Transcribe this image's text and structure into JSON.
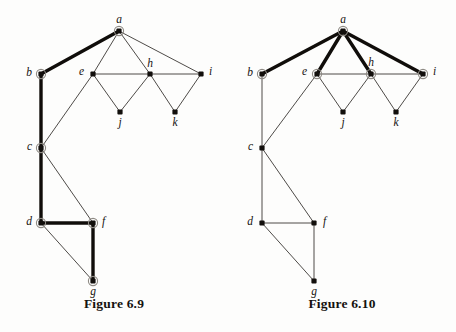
{
  "figures": [
    {
      "id": "figure-6-9",
      "caption": "Figure 6.9",
      "nodes": [
        {
          "id": "a",
          "label": "a",
          "x": 119,
          "y": 31,
          "marked": true,
          "label_dx": 0,
          "label_dy": -8,
          "label_anchor": "middle"
        },
        {
          "id": "b",
          "label": "b",
          "x": 41,
          "y": 74,
          "marked": true,
          "label_dx": -9,
          "label_dy": 2,
          "label_anchor": "end"
        },
        {
          "id": "c",
          "label": "c",
          "x": 41,
          "y": 148,
          "marked": true,
          "label_dx": -9,
          "label_dy": 2,
          "label_anchor": "end"
        },
        {
          "id": "d",
          "label": "d",
          "x": 41,
          "y": 223,
          "marked": true,
          "label_dx": -9,
          "label_dy": 2,
          "label_anchor": "end"
        },
        {
          "id": "e",
          "label": "e",
          "x": 93,
          "y": 74,
          "marked": false,
          "label_dx": -9,
          "label_dy": 1,
          "label_anchor": "end"
        },
        {
          "id": "f",
          "label": "f",
          "x": 93,
          "y": 223,
          "marked": true,
          "label_dx": 9,
          "label_dy": 2,
          "label_anchor": "start"
        },
        {
          "id": "g",
          "label": "g",
          "x": 93,
          "y": 281,
          "marked": true,
          "label_dx": 0,
          "label_dy": 14,
          "label_anchor": "middle"
        },
        {
          "id": "h",
          "label": "h",
          "x": 150,
          "y": 74,
          "marked": false,
          "label_dx": 0,
          "label_dy": -7,
          "label_anchor": "middle"
        },
        {
          "id": "i",
          "label": "i",
          "x": 201,
          "y": 74,
          "marked": false,
          "label_dx": 8,
          "label_dy": 1,
          "label_anchor": "start"
        },
        {
          "id": "j",
          "label": "j",
          "x": 120,
          "y": 112,
          "marked": false,
          "label_dx": 0,
          "label_dy": 14,
          "label_anchor": "middle"
        },
        {
          "id": "k",
          "label": "k",
          "x": 175,
          "y": 112,
          "marked": false,
          "label_dx": 0,
          "label_dy": 14,
          "label_anchor": "middle"
        }
      ],
      "edges": [
        {
          "from": "a",
          "to": "b",
          "bold": true
        },
        {
          "from": "a",
          "to": "e",
          "bold": false
        },
        {
          "from": "a",
          "to": "h",
          "bold": false
        },
        {
          "from": "a",
          "to": "i",
          "bold": false
        },
        {
          "from": "b",
          "to": "c",
          "bold": true
        },
        {
          "from": "c",
          "to": "d",
          "bold": true
        },
        {
          "from": "c",
          "to": "e",
          "bold": false
        },
        {
          "from": "c",
          "to": "f",
          "bold": false
        },
        {
          "from": "d",
          "to": "f",
          "bold": true
        },
        {
          "from": "d",
          "to": "g",
          "bold": false
        },
        {
          "from": "f",
          "to": "g",
          "bold": true
        },
        {
          "from": "e",
          "to": "h",
          "bold": false
        },
        {
          "from": "e",
          "to": "j",
          "bold": false
        },
        {
          "from": "h",
          "to": "j",
          "bold": false
        },
        {
          "from": "h",
          "to": "i",
          "bold": false
        },
        {
          "from": "h",
          "to": "k",
          "bold": false
        },
        {
          "from": "i",
          "to": "k",
          "bold": false
        }
      ]
    },
    {
      "id": "figure-6-10",
      "caption": "Figure 6.10",
      "nodes": [
        {
          "id": "a",
          "label": "a",
          "x": 115,
          "y": 31,
          "marked": true,
          "label_dx": 0,
          "label_dy": -8,
          "label_anchor": "middle"
        },
        {
          "id": "b",
          "label": "b",
          "x": 34,
          "y": 74,
          "marked": true,
          "label_dx": -9,
          "label_dy": 2,
          "label_anchor": "end"
        },
        {
          "id": "c",
          "label": "c",
          "x": 34,
          "y": 148,
          "marked": false,
          "label_dx": -9,
          "label_dy": 2,
          "label_anchor": "end"
        },
        {
          "id": "d",
          "label": "d",
          "x": 34,
          "y": 223,
          "marked": false,
          "label_dx": -9,
          "label_dy": 2,
          "label_anchor": "end"
        },
        {
          "id": "e",
          "label": "e",
          "x": 89,
          "y": 74,
          "marked": true,
          "label_dx": -10,
          "label_dy": 1,
          "label_anchor": "end"
        },
        {
          "id": "f",
          "label": "f",
          "x": 86,
          "y": 223,
          "marked": false,
          "label_dx": 9,
          "label_dy": 2,
          "label_anchor": "start"
        },
        {
          "id": "g",
          "label": "g",
          "x": 86,
          "y": 281,
          "marked": false,
          "label_dx": 0,
          "label_dy": 14,
          "label_anchor": "middle"
        },
        {
          "id": "h",
          "label": "h",
          "x": 143,
          "y": 74,
          "marked": true,
          "label_dx": 0,
          "label_dy": -8,
          "label_anchor": "middle"
        },
        {
          "id": "i",
          "label": "i",
          "x": 195,
          "y": 74,
          "marked": true,
          "label_dx": 10,
          "label_dy": 1,
          "label_anchor": "start"
        },
        {
          "id": "j",
          "label": "j",
          "x": 115,
          "y": 112,
          "marked": false,
          "label_dx": 0,
          "label_dy": 14,
          "label_anchor": "middle"
        },
        {
          "id": "k",
          "label": "k",
          "x": 168,
          "y": 112,
          "marked": false,
          "label_dx": 0,
          "label_dy": 14,
          "label_anchor": "middle"
        }
      ],
      "edges": [
        {
          "from": "a",
          "to": "b",
          "bold": true
        },
        {
          "from": "a",
          "to": "e",
          "bold": true
        },
        {
          "from": "a",
          "to": "h",
          "bold": true
        },
        {
          "from": "a",
          "to": "i",
          "bold": true
        },
        {
          "from": "b",
          "to": "c",
          "bold": false
        },
        {
          "from": "c",
          "to": "d",
          "bold": false
        },
        {
          "from": "c",
          "to": "e",
          "bold": false
        },
        {
          "from": "c",
          "to": "f",
          "bold": false
        },
        {
          "from": "d",
          "to": "f",
          "bold": false
        },
        {
          "from": "d",
          "to": "g",
          "bold": false
        },
        {
          "from": "f",
          "to": "g",
          "bold": false
        },
        {
          "from": "e",
          "to": "h",
          "bold": false
        },
        {
          "from": "e",
          "to": "j",
          "bold": false
        },
        {
          "from": "h",
          "to": "j",
          "bold": false
        },
        {
          "from": "h",
          "to": "i",
          "bold": false
        },
        {
          "from": "h",
          "to": "k",
          "bold": false
        },
        {
          "from": "i",
          "to": "k",
          "bold": false
        }
      ]
    }
  ],
  "style": {
    "background": "#fdfdfc",
    "edge_color": "#3a3733",
    "edge_bold_color": "#100d0a",
    "node_fill": "#120f0c",
    "node_ring": "#8e8a84",
    "label_color": "#16120e",
    "edge_width": 0.9,
    "edge_bold_width": 3.4,
    "node_radius": 2.6,
    "node_ring_radius": 4.6
  }
}
